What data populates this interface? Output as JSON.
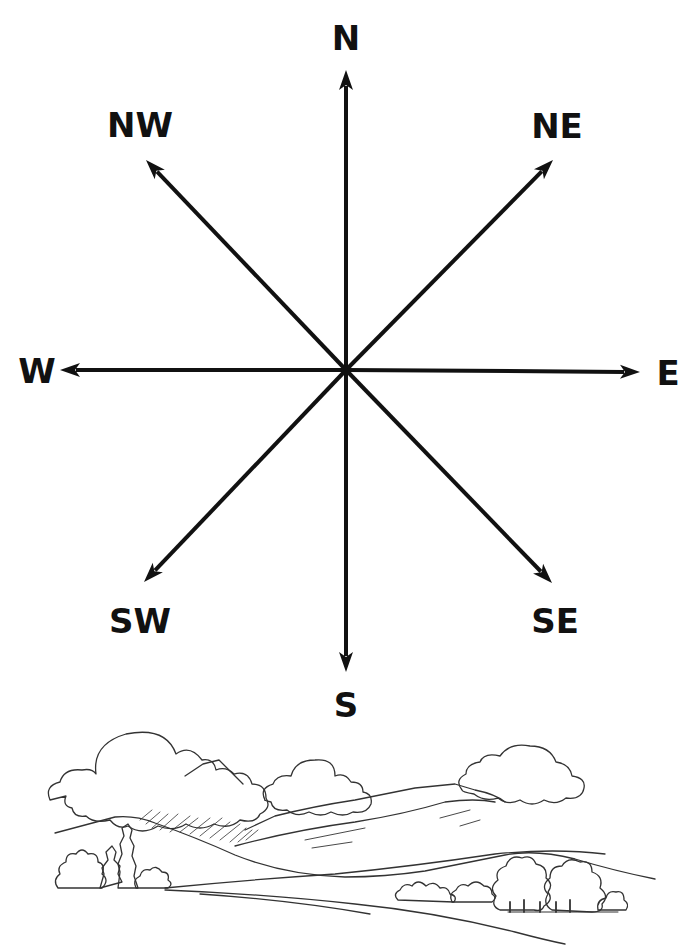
{
  "compass": {
    "center": {
      "x": 346,
      "y": 370
    },
    "stroke_color": "#111111",
    "directions": [
      {
        "key": "N",
        "label": "N",
        "tip": {
          "x": 346,
          "y": 70
        },
        "label_pos": {
          "x": 346,
          "y": 38
        }
      },
      {
        "key": "NE",
        "label": "NE",
        "tip": {
          "x": 553,
          "y": 160
        },
        "label_pos": {
          "x": 557,
          "y": 126
        }
      },
      {
        "key": "E",
        "label": "E",
        "tip": {
          "x": 640,
          "y": 372
        },
        "label_pos": {
          "x": 668,
          "y": 373
        }
      },
      {
        "key": "SE",
        "label": "SE",
        "tip": {
          "x": 552,
          "y": 583
        },
        "label_pos": {
          "x": 555,
          "y": 621
        }
      },
      {
        "key": "S",
        "label": "S",
        "tip": {
          "x": 346,
          "y": 672
        },
        "label_pos": {
          "x": 346,
          "y": 705
        }
      },
      {
        "key": "SW",
        "label": "SW",
        "tip": {
          "x": 144,
          "y": 582
        },
        "label_pos": {
          "x": 140,
          "y": 621
        }
      },
      {
        "key": "W",
        "label": "W",
        "tip": {
          "x": 60,
          "y": 370
        },
        "label_pos": {
          "x": 37,
          "y": 371
        }
      },
      {
        "key": "NW",
        "label": "NW",
        "tip": {
          "x": 146,
          "y": 160
        },
        "label_pos": {
          "x": 140,
          "y": 125
        }
      }
    ]
  },
  "landscape": {
    "description": "Pencil sketch of a landscape with clouds, mountains, hills, trees and bushes",
    "line_color": "#333333"
  }
}
